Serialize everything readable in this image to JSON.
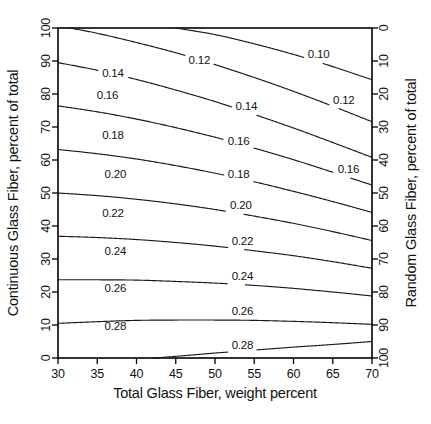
{
  "figure": {
    "background_color": "#ffffff",
    "line_color": "#1a1a1a",
    "axis_color": "#000000",
    "width": 431,
    "height": 424
  },
  "chart_data": {
    "type": "contour",
    "title": "",
    "subtitle": "",
    "xlabel": "Total Glass Fiber, weight percent",
    "ylabel": "Continuous Glass Fiber, percent of total",
    "y2label": "Random Glass Fiber, percent of total",
    "xlim": [
      30,
      70
    ],
    "ylim": [
      0,
      100
    ],
    "y2lim": [
      100,
      0
    ],
    "grid": false,
    "legend": "none",
    "xticks": [
      30,
      35,
      40,
      45,
      50,
      55,
      60,
      65,
      70
    ],
    "xticklabels": [
      "30",
      "35",
      "40",
      "45",
      "50",
      "55",
      "60",
      "65",
      "70"
    ],
    "yticks": [
      0,
      10,
      20,
      30,
      40,
      50,
      60,
      70,
      80,
      90,
      100
    ],
    "yticklabels": [
      "0",
      "10",
      "20",
      "30",
      "40",
      "50",
      "60",
      "70",
      "80",
      "90",
      "100"
    ],
    "y2ticks": [
      0,
      10,
      20,
      30,
      40,
      50,
      60,
      70,
      80,
      90,
      100
    ],
    "y2ticklabels": [
      "0",
      "10",
      "20",
      "30",
      "40",
      "50",
      "60",
      "70",
      "80",
      "90",
      "100"
    ],
    "levels": [
      0.1,
      0.12,
      0.14,
      0.16,
      0.18,
      0.2,
      0.22,
      0.24,
      0.26,
      0.28,
      0.3
    ],
    "level_labels": [
      "0.10",
      "0.12",
      "0.14",
      "0.16",
      "0.18",
      "0.20",
      "0.22",
      "0.24",
      "0.26",
      "0.28",
      ""
    ],
    "contours": [
      {
        "level": 0.1,
        "label": "0.10",
        "points": [
          [
            45.0,
            100.0
          ],
          [
            50.0,
            98.0
          ],
          [
            55.0,
            95.2
          ],
          [
            60.0,
            92.0
          ],
          [
            65.0,
            88.3
          ],
          [
            70.0,
            84.3
          ]
        ],
        "label_positions": [
          [
            63.2,
            91.7
          ]
        ]
      },
      {
        "level": 0.12,
        "label": "0.12",
        "points": [
          [
            31.5,
            100.0
          ],
          [
            35.0,
            98.4
          ],
          [
            40.0,
            95.6
          ],
          [
            45.0,
            92.5
          ],
          [
            50.0,
            88.9
          ],
          [
            55.0,
            85.0
          ],
          [
            60.0,
            80.8
          ],
          [
            65.0,
            76.3
          ],
          [
            70.0,
            71.6
          ]
        ],
        "label_positions": [
          [
            48.0,
            90.0
          ],
          [
            66.4,
            78.0
          ]
        ]
      },
      {
        "level": 0.14,
        "label": "0.14",
        "points": [
          [
            30.0,
            89.5
          ],
          [
            35.0,
            87.2
          ],
          [
            40.0,
            84.4
          ],
          [
            45.0,
            81.2
          ],
          [
            50.0,
            77.7
          ],
          [
            55.0,
            73.8
          ],
          [
            60.0,
            69.7
          ],
          [
            65.0,
            65.3
          ],
          [
            70.0,
            60.8
          ]
        ],
        "label_positions": [
          [
            37.0,
            86.2
          ],
          [
            54.0,
            76.0
          ]
        ]
      },
      {
        "level": 0.16,
        "label": "0.16",
        "points": [
          [
            30.0,
            76.4
          ],
          [
            35.0,
            74.6
          ],
          [
            40.0,
            72.4
          ],
          [
            45.0,
            69.8
          ],
          [
            50.0,
            66.9
          ],
          [
            55.0,
            63.6
          ],
          [
            60.0,
            60.1
          ],
          [
            65.0,
            56.3
          ],
          [
            70.0,
            52.4
          ]
        ],
        "label_positions": [
          [
            36.3,
            79.5
          ],
          [
            53.0,
            65.5
          ],
          [
            67.0,
            57.0
          ]
        ]
      },
      {
        "level": 0.18,
        "label": "0.18",
        "points": [
          [
            30.0,
            63.2
          ],
          [
            35.0,
            61.9
          ],
          [
            40.0,
            60.3
          ],
          [
            45.0,
            58.3
          ],
          [
            50.0,
            56.0
          ],
          [
            55.0,
            53.4
          ],
          [
            60.0,
            50.5
          ],
          [
            65.0,
            47.4
          ],
          [
            70.0,
            44.1
          ]
        ],
        "label_positions": [
          [
            37.0,
            67.4
          ],
          [
            53.0,
            55.6
          ]
        ]
      },
      {
        "level": 0.2,
        "label": "0.20",
        "points": [
          [
            30.0,
            50.0
          ],
          [
            35.0,
            49.2
          ],
          [
            40.0,
            48.1
          ],
          [
            45.0,
            46.7
          ],
          [
            50.0,
            45.0
          ],
          [
            55.0,
            43.0
          ],
          [
            60.0,
            40.8
          ],
          [
            65.0,
            38.3
          ],
          [
            70.0,
            35.6
          ]
        ],
        "label_positions": [
          [
            37.3,
            55.5
          ],
          [
            53.3,
            46.0
          ]
        ]
      },
      {
        "level": 0.22,
        "label": "0.22",
        "points": [
          [
            30.0,
            36.9
          ],
          [
            35.0,
            36.5
          ],
          [
            40.0,
            35.9
          ],
          [
            45.0,
            35.0
          ],
          [
            50.0,
            33.9
          ],
          [
            55.0,
            32.5
          ],
          [
            60.0,
            31.0
          ],
          [
            65.0,
            29.2
          ],
          [
            70.0,
            27.2
          ]
        ],
        "label_positions": [
          [
            37.0,
            43.5
          ],
          [
            53.5,
            35.3
          ]
        ]
      },
      {
        "level": 0.24,
        "label": "0.24",
        "points": [
          [
            30.0,
            23.7
          ],
          [
            35.0,
            23.7
          ],
          [
            40.0,
            23.6
          ],
          [
            45.0,
            23.2
          ],
          [
            50.0,
            22.7
          ],
          [
            55.0,
            22.0
          ],
          [
            60.0,
            21.1
          ],
          [
            65.0,
            20.0
          ],
          [
            70.0,
            18.8
          ]
        ],
        "label_positions": [
          [
            37.3,
            32.0
          ],
          [
            53.5,
            24.6
          ]
        ]
      },
      {
        "level": 0.26,
        "label": "0.26",
        "points": [
          [
            30.0,
            10.5
          ],
          [
            35.0,
            11.0
          ],
          [
            40.0,
            11.4
          ],
          [
            45.0,
            11.5
          ],
          [
            50.0,
            11.5
          ],
          [
            55.0,
            11.4
          ],
          [
            60.0,
            11.1
          ],
          [
            65.0,
            10.7
          ],
          [
            70.0,
            10.2
          ]
        ],
        "label_positions": [
          [
            37.3,
            20.8
          ],
          [
            53.5,
            14.0
          ]
        ]
      },
      {
        "level": 0.28,
        "label": "0.28",
        "points": [
          [
            42.2,
            0.0
          ],
          [
            45.0,
            0.5
          ],
          [
            50.0,
            1.5
          ],
          [
            55.0,
            2.4
          ],
          [
            60.0,
            3.3
          ],
          [
            65.0,
            4.1
          ],
          [
            70.0,
            5.0
          ]
        ],
        "label_positions": [
          [
            37.3,
            9.4
          ],
          [
            53.5,
            3.5
          ]
        ]
      }
    ]
  },
  "axes": {
    "left": {
      "title": "Continuous Glass Fiber, percent of total",
      "ticks": [
        "0",
        "10",
        "20",
        "30",
        "40",
        "50",
        "60",
        "70",
        "80",
        "90",
        "100"
      ]
    },
    "right": {
      "title": "Random Glass Fiber, percent of total",
      "ticks": [
        "0",
        "10",
        "20",
        "30",
        "40",
        "50",
        "60",
        "70",
        "80",
        "90",
        "100"
      ]
    },
    "bottom": {
      "title": "Total Glass Fiber, weight percent",
      "ticks": [
        "30",
        "35",
        "40",
        "45",
        "50",
        "55",
        "60",
        "65",
        "70"
      ]
    }
  }
}
